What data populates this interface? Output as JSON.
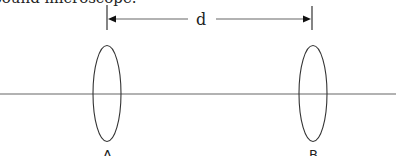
{
  "caption": "mpound microscope.",
  "distance_label": "d",
  "lenses": [
    {
      "label": "A",
      "cx": 107
    },
    {
      "label": "B",
      "cx": 313
    }
  ],
  "colors": {
    "line": "#555555",
    "lens": "#333333",
    "text": "#222222"
  }
}
